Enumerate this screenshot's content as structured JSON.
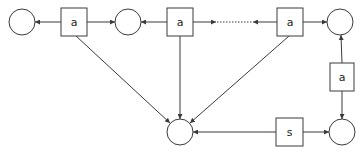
{
  "diagram": {
    "type": "petri-net",
    "places": [
      {
        "id": "p1",
        "cx": 22,
        "cy": 22,
        "r": 13
      },
      {
        "id": "p2",
        "cx": 128,
        "cy": 22,
        "r": 13
      },
      {
        "id": "p3",
        "cx": 340,
        "cy": 22,
        "r": 13
      },
      {
        "id": "p4",
        "cx": 342,
        "cy": 132,
        "r": 13
      },
      {
        "id": "p5",
        "cx": 180,
        "cy": 132,
        "r": 13
      }
    ],
    "transitions": [
      {
        "id": "t1",
        "label": "a",
        "x": 61,
        "y": 8,
        "w": 26,
        "h": 28
      },
      {
        "id": "t2",
        "label": "a",
        "x": 167,
        "y": 8,
        "w": 26,
        "h": 28
      },
      {
        "id": "t3",
        "label": "a",
        "x": 277,
        "y": 8,
        "w": 26,
        "h": 28
      },
      {
        "id": "t4",
        "label": "a",
        "x": 330,
        "y": 63,
        "w": 24,
        "h": 28
      },
      {
        "id": "t5",
        "label": "s",
        "x": 276,
        "y": 118,
        "w": 27,
        "h": 28
      }
    ],
    "labels": {
      "t1": "a",
      "t2": "a",
      "t3": "a",
      "t4": "a",
      "t5": "s"
    }
  }
}
